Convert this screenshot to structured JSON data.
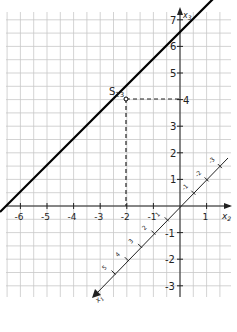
{
  "figure": {
    "type": "coordinate-diagram",
    "axes": {
      "x2": {
        "label": "x",
        "subscript": "2",
        "ticks": [
          -6,
          -5,
          -4,
          -3,
          -2,
          -1,
          1
        ]
      },
      "x3": {
        "label": "x",
        "subscript": "3",
        "ticks": [
          7,
          6,
          5,
          4,
          3,
          2,
          1,
          -1,
          -2,
          -3
        ]
      },
      "x1": {
        "label": "x",
        "subscript": "1",
        "ticks": [
          -3,
          -2,
          -1,
          1,
          2,
          3,
          4,
          5
        ]
      }
    },
    "trace_line": {
      "description": "line through (-6,0) and (0,6) in x2-x3 plane",
      "slope": 1
    },
    "point": {
      "label": "S",
      "subscript": "23",
      "x2": -2,
      "x3": 4
    },
    "colors": {
      "grid": "#c8c8c8",
      "axis": "#222222",
      "line": "#000000",
      "background": "#ffffff"
    }
  },
  "labels": {
    "x2_ticks": [
      "-6",
      "-5",
      "-4",
      "-3",
      "-2",
      "-1",
      "1"
    ],
    "x3_ticks": [
      "7",
      "6",
      "5",
      "4",
      "3",
      "2",
      "1",
      "-1",
      "-2",
      "-3"
    ],
    "x1_ticks": [
      "-3",
      "-2",
      "-1",
      "1",
      "2",
      "3",
      "4",
      "5"
    ],
    "x2_axis": "x",
    "x2_sub": "2",
    "x3_axis": "x",
    "x3_sub": "3",
    "x1_axis": "x",
    "x1_sub": "1",
    "point_name": "S",
    "point_sub": "23"
  }
}
